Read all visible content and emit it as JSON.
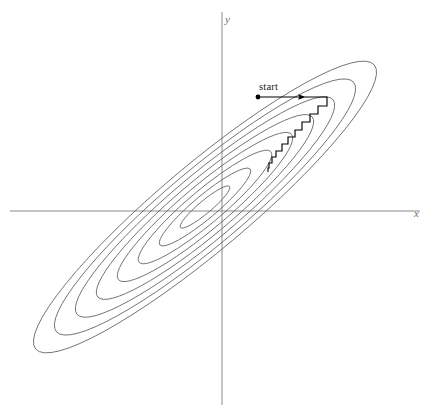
{
  "figure": {
    "background_color": "#ffffff",
    "contour_color": "#5f5f5f",
    "axis_color": "#8a8a8a",
    "path_color": "#000000",
    "axes": {
      "x_label": "x",
      "y_label": "y",
      "origin_px": [
        222,
        211
      ],
      "x_axis_extent_px": [
        10,
        420
      ],
      "y_axis_extent_px": [
        12,
        405
      ]
    },
    "annotations": {
      "start_label": "start"
    }
  },
  "chart_data": {
    "type": "line",
    "title": "",
    "subtitle": "",
    "xlabel": "x",
    "ylabel": "y",
    "grid": false,
    "legend": null,
    "axis_style": "two-axis cross through origin, no tick marks, no tick labels",
    "xlim": [
      -212,
      198
    ],
    "ylim": [
      -194,
      199
    ],
    "contours": {
      "kind": "nested-ellipses",
      "count": 8,
      "center_px": [
        205,
        207
      ],
      "rotation_deg": -40,
      "aspect_ratio": 5.1,
      "semi_major_axes_px": [
        32,
        59,
        86,
        113,
        140,
        167,
        194,
        221
      ],
      "semi_minor_axes_px": [
        6.3,
        11.6,
        16.9,
        22.2,
        27.5,
        32.8,
        38.1,
        43.3
      ]
    },
    "series": [
      {
        "name": "coordinate-descent path",
        "type": "staircase",
        "color": "#000000",
        "start_marker": "dot",
        "arrow": true,
        "points_px": [
          [
            258,
            97
          ],
          [
            305,
            97
          ],
          [
            327,
            97
          ],
          [
            327,
            106
          ],
          [
            318,
            106
          ],
          [
            318,
            114
          ],
          [
            310,
            114
          ],
          [
            310,
            122
          ],
          [
            302,
            122
          ],
          [
            302,
            130
          ],
          [
            295,
            130
          ],
          [
            295,
            137
          ],
          [
            288,
            137
          ],
          [
            288,
            144
          ],
          [
            282,
            144
          ],
          [
            282,
            151
          ],
          [
            276,
            151
          ],
          [
            276,
            157
          ],
          [
            272,
            157
          ],
          [
            272,
            163
          ],
          [
            269,
            163
          ],
          [
            269,
            168
          ],
          [
            268,
            168
          ],
          [
            268,
            172
          ]
        ],
        "step_count": 10
      }
    ]
  }
}
